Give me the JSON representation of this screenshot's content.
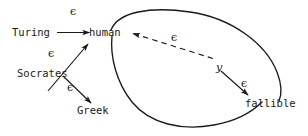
{
  "diagram": {
    "stroke_color": "#1a1a1a",
    "background": "#ffffff",
    "nodes": [
      {
        "id": "turing",
        "label": "Turing",
        "x": 12,
        "y": 27
      },
      {
        "id": "human",
        "label": "human",
        "x": 89,
        "y": 27
      },
      {
        "id": "socrates",
        "label": "Socrates",
        "x": 17,
        "y": 68
      },
      {
        "id": "greek",
        "label": "Greek",
        "x": 77,
        "y": 105
      },
      {
        "id": "fallible",
        "label": "fallible",
        "x": 245,
        "y": 98
      }
    ],
    "edge_labels": [
      {
        "id": "eps-turing-human",
        "text": "ϵ",
        "x": 70,
        "y": 6
      },
      {
        "id": "eps-socrates-human",
        "text": "ϵ",
        "x": 48,
        "y": 48
      },
      {
        "id": "eps-socrates-greek",
        "text": "ϵ",
        "x": 67,
        "y": 82
      },
      {
        "id": "eps-dashed-human",
        "text": "ϵ",
        "x": 171,
        "y": 32
      },
      {
        "id": "eps-y-fallible",
        "text": "ϵ",
        "x": 241,
        "y": 78
      },
      {
        "id": "var-y",
        "text": "y",
        "x": 216,
        "y": 62
      }
    ],
    "edges": [
      {
        "id": "turing-to-human",
        "from": "turing",
        "to": "human",
        "style": "solid",
        "arrow": true
      },
      {
        "id": "socrates-to-human",
        "from": "socrates",
        "to": "human",
        "style": "solid",
        "arrow": true
      },
      {
        "id": "socrates-to-greek",
        "from": "socrates",
        "to": "greek",
        "style": "solid",
        "arrow": true
      },
      {
        "id": "y-to-human",
        "from": "y",
        "to": "human",
        "style": "dashed",
        "arrow": true
      },
      {
        "id": "y-to-fallible",
        "from": "y",
        "to": "fallible",
        "style": "solid",
        "arrow": true
      }
    ],
    "shapes": [
      {
        "id": "ellipse-arc-upper",
        "type": "arc",
        "description": "large tilted ellipse upper arc from human to fallible"
      },
      {
        "id": "ellipse-arc-lower",
        "type": "arc",
        "description": "large tilted ellipse lower arc from fallible back to human"
      }
    ]
  }
}
